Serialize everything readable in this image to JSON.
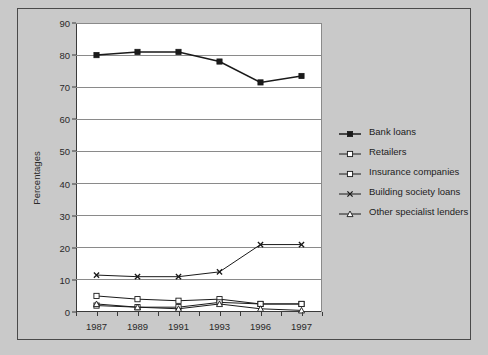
{
  "chart_data": {
    "type": "line",
    "title": "",
    "xlabel": "",
    "ylabel": "Percentages",
    "categories": [
      "1987",
      "1989",
      "1991",
      "1993",
      "1996",
      "1997"
    ],
    "ylim": [
      0,
      90
    ],
    "ytick_step": 10,
    "yticks": [
      "0",
      "10",
      "20",
      "30",
      "40",
      "50",
      "60",
      "70",
      "80",
      "90"
    ],
    "grid": "horizontal",
    "legend_position": "right",
    "series": [
      {
        "name": "Bank loans",
        "marker": "filled-square",
        "values": [
          80,
          81,
          81,
          78,
          71.5,
          73.5
        ]
      },
      {
        "name": "Retailers",
        "marker": "open-square",
        "values": [
          5,
          4,
          3.5,
          4,
          2.5,
          2.5
        ]
      },
      {
        "name": "Insurance companies",
        "marker": "open-square",
        "values": [
          2,
          1.5,
          1.5,
          3,
          2.5,
          2.5
        ]
      },
      {
        "name": "Building society loans",
        "marker": "filled-cross",
        "values": [
          11.5,
          11,
          11,
          12.5,
          21,
          21
        ]
      },
      {
        "name": "Other specialist lenders",
        "marker": "open-triangle",
        "values": [
          2.5,
          1.5,
          1,
          2.5,
          1,
          0.5
        ]
      }
    ],
    "colors": {
      "background": "#c9c9c9",
      "plot_background": "#ffffff",
      "axis": "#3a3a3a",
      "gridline": "#8a8a8a",
      "series_line": "#1a1a1a",
      "border": "#4a4a4a"
    }
  }
}
